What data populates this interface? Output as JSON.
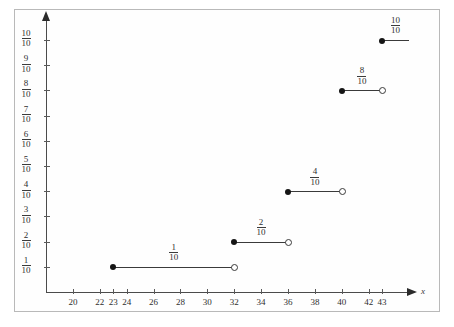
{
  "chart_data": {
    "type": "line",
    "title": "",
    "subtitle": "",
    "xlabel": "x",
    "ylabel": "",
    "grid": false,
    "legend": null,
    "xlim": [
      18,
      45
    ],
    "ylim": [
      0,
      1.05
    ],
    "x_ticks": [
      20,
      22,
      23,
      24,
      26,
      28,
      30,
      32,
      34,
      36,
      38,
      40,
      42,
      43
    ],
    "x_tick_labels": [
      "20",
      "22",
      "23",
      "24",
      "26",
      "28",
      "30",
      "32",
      "34",
      "36",
      "38",
      "40",
      "42",
      "43"
    ],
    "y_ticks": [
      0.1,
      0.2,
      0.3,
      0.4,
      0.5,
      0.6,
      0.7,
      0.8,
      0.9,
      1.0
    ],
    "y_tick_labels": [
      {
        "numerator": "1",
        "denominator": "10"
      },
      {
        "numerator": "2",
        "denominator": "10"
      },
      {
        "numerator": "3",
        "denominator": "10"
      },
      {
        "numerator": "4",
        "denominator": "10"
      },
      {
        "numerator": "5",
        "denominator": "10"
      },
      {
        "numerator": "6",
        "denominator": "10"
      },
      {
        "numerator": "7",
        "denominator": "10"
      },
      {
        "numerator": "8",
        "denominator": "10"
      },
      {
        "numerator": "9",
        "denominator": "10"
      },
      {
        "numerator": "10",
        "denominator": "10"
      }
    ],
    "steps": [
      {
        "x_start": 23,
        "x_end": 32,
        "y": 0.1,
        "label_numerator": "1",
        "label_denominator": "10",
        "left_endpoint": "closed",
        "right_endpoint": "open"
      },
      {
        "x_start": 32,
        "x_end": 36,
        "y": 0.2,
        "label_numerator": "2",
        "label_denominator": "10",
        "left_endpoint": "closed",
        "right_endpoint": "open"
      },
      {
        "x_start": 36,
        "x_end": 40,
        "y": 0.4,
        "label_numerator": "4",
        "label_denominator": "10",
        "left_endpoint": "closed",
        "right_endpoint": "open"
      },
      {
        "x_start": 40,
        "x_end": 43,
        "y": 0.8,
        "label_numerator": "8",
        "label_denominator": "10",
        "left_endpoint": "closed",
        "right_endpoint": "open"
      },
      {
        "x_start": 43,
        "x_end": 45,
        "y": 1.0,
        "label_numerator": "10",
        "label_denominator": "10",
        "left_endpoint": "closed",
        "right_endpoint": "none"
      }
    ],
    "colors": {
      "line": "#3a3a3a",
      "axis": "#4b4b4b",
      "text": "#2f2f2f",
      "border": "#b9b9b9",
      "background": "#ffffff"
    }
  }
}
